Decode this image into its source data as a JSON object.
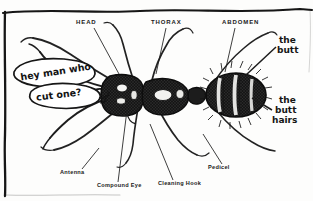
{
  "figure": {
    "background_color": "#fdfdfc",
    "ink_color": "#161616"
  },
  "frame": {
    "name": "hand-drawn-border"
  },
  "printed_labels": {
    "head": "HEAD",
    "thorax": "THORAX",
    "abdomen": "ABDOMEN",
    "antenna": "Antenna",
    "compound_eye": "Compound Eye",
    "cleaning_hook": "Cleaning Hook",
    "pedicel": "Pedicel"
  },
  "handwritten_annotations": {
    "butt_line1": "the",
    "butt_line2": "butt",
    "butt_hairs_line1": "the",
    "butt_hairs_line2": "butt",
    "butt_hairs_line3": "hairs"
  },
  "speech_bubble": {
    "line1": "hey man who",
    "line2": "cut one?"
  }
}
